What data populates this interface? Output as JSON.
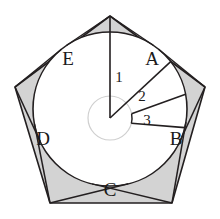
{
  "figure": {
    "canvas": {
      "width": 220,
      "height": 219
    },
    "colors": {
      "shaded_fill": "#d3d3d3",
      "circle_fill": "#ffffff",
      "stroke": "#231f20",
      "background": "#ffffff",
      "label_color": "#1a1a1a"
    },
    "geometry": {
      "pentagon_center_x": 110,
      "pentagon_center_y": 109,
      "pentagon_circumradius": 95,
      "inscribed_circle_center_x": 110,
      "inscribed_circle_center_y": 109,
      "inscribed_circle_radius": 77,
      "hub_center_x": 110,
      "hub_center_y": 118,
      "hub_radius": 22,
      "pentagon_vertices": [
        {
          "x": 110,
          "y": 16
        },
        {
          "x": 205,
          "y": 87
        },
        {
          "x": 172,
          "y": 203
        },
        {
          "x": 50,
          "y": 203
        },
        {
          "x": 15,
          "y": 87
        }
      ]
    },
    "corner_regions": [
      {
        "id": "A",
        "label": "A",
        "label_x": 152,
        "label_y": 61
      },
      {
        "id": "B",
        "label": "B",
        "label_x": 176,
        "label_y": 141
      },
      {
        "id": "C",
        "label": "C",
        "label_x": 110,
        "label_y": 192
      },
      {
        "id": "D",
        "label": "D",
        "label_x": 43,
        "label_y": 141
      },
      {
        "id": "E",
        "label": "E",
        "label_x": 68,
        "label_y": 61
      }
    ],
    "sectors": [
      {
        "id": "1",
        "label": "1",
        "label_x": 119,
        "label_y": 79,
        "start_angle_deg": -90,
        "end_angle_deg": -38
      },
      {
        "id": "2",
        "label": "2",
        "label_x": 142,
        "label_y": 98,
        "start_angle_deg": -38,
        "end_angle_deg": -11
      },
      {
        "id": "3",
        "label": "3",
        "label_x": 147,
        "label_y": 122,
        "start_angle_deg": -11,
        "end_angle_deg": 14
      }
    ]
  }
}
